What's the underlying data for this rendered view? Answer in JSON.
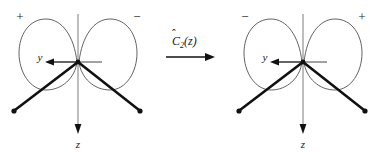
{
  "figure": {
    "width": 385,
    "height": 152,
    "background_color": "#ffffff",
    "line_color": "#111111",
    "lobe_stroke_color": "#3b3b3b",
    "axis_gray_color": "#6e6e6e"
  },
  "operator": {
    "symbol": "C",
    "hat": "̂",
    "subscript": "2",
    "argument": "(z)",
    "full_label": "Ĉ₂(z)",
    "arrow_direction": "right"
  },
  "left_diagram": {
    "name": "before-rotation",
    "lobe_left_sign": "+",
    "lobe_right_sign": "−",
    "y_axis_label": "y",
    "z_axis_label": "z",
    "y_axis_direction": "left",
    "z_axis_direction": "down",
    "bonds": [
      {
        "name": "bond-left",
        "direction": "down-left"
      },
      {
        "name": "bond-right",
        "direction": "down-right"
      }
    ]
  },
  "right_diagram": {
    "name": "after-rotation",
    "lobe_left_sign": "−",
    "lobe_right_sign": "+",
    "y_axis_label": "y",
    "z_axis_label": "z",
    "y_axis_direction": "left",
    "z_axis_direction": "down",
    "bonds": [
      {
        "name": "bond-left",
        "direction": "down-left"
      },
      {
        "name": "bond-right",
        "direction": "down-right"
      }
    ]
  }
}
